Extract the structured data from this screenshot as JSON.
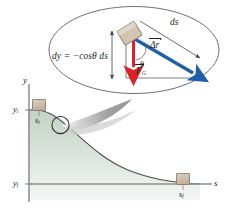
{
  "figure": {
    "kind": "physics-diagram",
    "background": "#ffffff"
  },
  "colors": {
    "ink": "#231f20",
    "displacement_arrow": "#1f5fa9",
    "force_arrow": "#d8232a",
    "block_fill": "#cdbfae",
    "block_stroke": "#8c7f6f",
    "slope_fill_top": "#c9d6cc",
    "slope_fill_bottom": "#eef2ef",
    "callout_gray": "#a9a9a9",
    "ellipse_stroke": "#6f6f6f",
    "axis": "#8e8e8e"
  },
  "callout": {
    "name": "magnified-detail",
    "equation": "dy = −cosθ ds",
    "equation_parts": {
      "dy": "dy",
      "equals": "=",
      "rhs": "−cosθ ds"
    },
    "arc_length_label": "ds",
    "displacement_label": "Δr",
    "displacement_label_full": "Δr⃗",
    "force_label": "F",
    "force_subscript": "G",
    "force_label_full": "F⃗_G",
    "angle_label": "θ",
    "block_label": ""
  },
  "axes": {
    "y_axis_label": "y",
    "s_axis_label": "s",
    "y_initial_label": "y",
    "y_initial_sub": "i",
    "y_final_label": "y",
    "y_final_sub": "f"
  },
  "path": {
    "start_position_label": "s",
    "start_position_sub": "i",
    "end_position_label": "s",
    "end_position_sub": "f",
    "magnify_marker": "circle-on-curve"
  }
}
